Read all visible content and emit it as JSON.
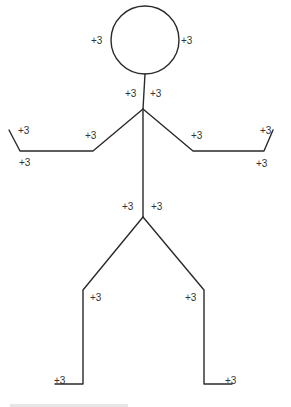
{
  "figure": {
    "colors": {
      "line": "#2a2a2a",
      "label": "#333333",
      "background": "#ffffff"
    }
  },
  "labels": [
    {
      "id": "head-left",
      "text": "+3",
      "x": 91,
      "y": 36
    },
    {
      "id": "head-right",
      "text": "+3",
      "x": 181,
      "y": 36
    },
    {
      "id": "neck-left",
      "text": "+3",
      "x": 125,
      "y": 89
    },
    {
      "id": "neck-right",
      "text": "+3",
      "x": 150,
      "y": 89
    },
    {
      "id": "left-hand-top",
      "text": "+3",
      "x": 18,
      "y": 126
    },
    {
      "id": "left-elbow",
      "text": "+3",
      "x": 85,
      "y": 131
    },
    {
      "id": "right-elbow",
      "text": "+3",
      "x": 191,
      "y": 131
    },
    {
      "id": "right-hand-top",
      "text": "+3",
      "x": 260,
      "y": 126
    },
    {
      "id": "left-hand-bottom",
      "text": "+3",
      "x": 19,
      "y": 158
    },
    {
      "id": "right-hand-bottom",
      "text": "+3",
      "x": 256,
      "y": 159
    },
    {
      "id": "hip-left",
      "text": "+3",
      "x": 122,
      "y": 202
    },
    {
      "id": "hip-right",
      "text": "+3",
      "x": 151,
      "y": 202
    },
    {
      "id": "left-knee",
      "text": "+3",
      "x": 90,
      "y": 293
    },
    {
      "id": "right-knee",
      "text": "+3",
      "x": 185,
      "y": 293
    },
    {
      "id": "left-foot",
      "text": "+3",
      "x": 54,
      "y": 376
    },
    {
      "id": "right-foot",
      "text": "+3",
      "x": 225,
      "y": 376
    }
  ],
  "geometry": {
    "head": {
      "cx": 145,
      "cy": 40,
      "r": 34
    },
    "neck_top": [
      145,
      74
    ],
    "shoulder": [
      143,
      109
    ],
    "hip": [
      143,
      217
    ],
    "left_arm": [
      [
        143,
        109
      ],
      [
        93,
        151
      ],
      [
        20,
        151
      ],
      [
        9,
        130
      ]
    ],
    "right_arm": [
      [
        143,
        109
      ],
      [
        193,
        151
      ],
      [
        264,
        151
      ],
      [
        273,
        130
      ]
    ],
    "left_leg": [
      [
        143,
        217
      ],
      [
        83,
        290
      ],
      [
        83,
        384
      ],
      [
        55,
        384
      ]
    ],
    "right_leg": [
      [
        143,
        217
      ],
      [
        204,
        290
      ],
      [
        204,
        384
      ],
      [
        232,
        384
      ]
    ]
  }
}
